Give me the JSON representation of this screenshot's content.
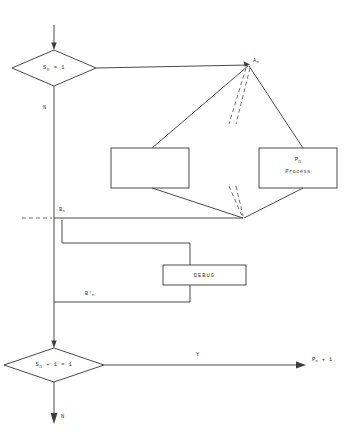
{
  "diagram": {
    "colors": {
      "line": "#4a4a4a",
      "dashed_line": "#6e6e6e",
      "text": "#3a3a3a",
      "background": "#ffffff"
    },
    "nodes": {
      "decision_top": {
        "label_main": "S",
        "label_sub": "n",
        "label_rest": "= 1",
        "full_text": "S n = 1",
        "shape": "diamond"
      },
      "decision_bottom": {
        "label_main": "S",
        "label_sub": "n",
        "label_rest": "+ 1 = 1",
        "full_text": "S n + 1 = 1",
        "shape": "diamond"
      },
      "process_empty": {
        "label": "",
        "shape": "rectangle"
      },
      "process_pn": {
        "line1_main": "P",
        "line1_sub": "n",
        "line2": "Process",
        "shape": "rectangle"
      },
      "debug_box": {
        "label": "DEBUG",
        "shape": "rectangle"
      }
    },
    "connector_labels": {
      "junction_an": {
        "main": "A",
        "sub": "n"
      },
      "junction_bn": {
        "main": "B",
        "sub": "n"
      },
      "junction_bn_prime": {
        "main": "B",
        "prime": "'",
        "sub": "n"
      },
      "terminal_pn_plus_1": {
        "main": "P",
        "sub": "n",
        "rest": "+ 1"
      }
    },
    "branch_labels": {
      "top_no": "N",
      "bottom_yes": "Y",
      "bottom_no": "N"
    }
  }
}
